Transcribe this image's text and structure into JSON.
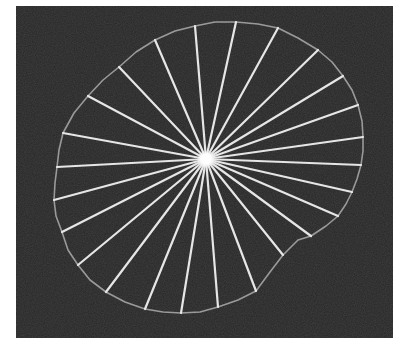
{
  "figure": {
    "width": 404,
    "height": 344,
    "page_background": "#ffffff",
    "frame": {
      "x": 16,
      "y": 6,
      "width": 377,
      "height": 332,
      "fill": "#262626"
    },
    "center": {
      "x": 206,
      "y": 159,
      "glow_radius": 9,
      "color": "#ffffff"
    },
    "spoke_color": "#e6e6e6",
    "spoke_width": 2.2,
    "contour_color": "#9a9a9a",
    "contour_width": 1.6,
    "contour": [
      [
        195,
        26
      ],
      [
        215,
        22
      ],
      [
        236,
        22
      ],
      [
        258,
        24
      ],
      [
        278,
        28
      ],
      [
        298,
        38
      ],
      [
        318,
        50
      ],
      [
        332,
        62
      ],
      [
        343,
        76
      ],
      [
        352,
        90
      ],
      [
        358,
        105
      ],
      [
        362,
        121
      ],
      [
        363,
        137
      ],
      [
        363,
        151
      ],
      [
        361,
        165
      ],
      [
        357,
        179
      ],
      [
        352,
        192
      ],
      [
        346,
        204
      ],
      [
        338,
        216
      ],
      [
        326,
        226
      ],
      [
        311,
        236
      ],
      [
        298,
        240
      ],
      [
        283,
        255
      ],
      [
        270,
        272
      ],
      [
        256,
        291
      ],
      [
        238,
        300
      ],
      [
        218,
        307
      ],
      [
        200,
        312
      ],
      [
        181,
        313
      ],
      [
        163,
        312
      ],
      [
        145,
        309
      ],
      [
        125,
        302
      ],
      [
        106,
        292
      ],
      [
        90,
        280
      ],
      [
        78,
        265
      ],
      [
        68,
        250
      ],
      [
        62,
        232
      ],
      [
        56,
        216
      ],
      [
        54,
        200
      ],
      [
        55,
        183
      ],
      [
        57,
        167
      ],
      [
        59,
        150
      ],
      [
        63,
        133
      ],
      [
        74,
        113
      ],
      [
        88,
        96
      ],
      [
        103,
        80
      ],
      [
        119,
        67
      ],
      [
        136,
        52
      ],
      [
        155,
        40
      ],
      [
        175,
        31
      ]
    ],
    "spokes": [
      [
        195,
        26
      ],
      [
        236,
        22
      ],
      [
        278,
        28
      ],
      [
        318,
        50
      ],
      [
        343,
        76
      ],
      [
        358,
        105
      ],
      [
        363,
        137
      ],
      [
        361,
        165
      ],
      [
        352,
        192
      ],
      [
        338,
        216
      ],
      [
        311,
        236
      ],
      [
        283,
        255
      ],
      [
        256,
        291
      ],
      [
        218,
        307
      ],
      [
        181,
        313
      ],
      [
        145,
        309
      ],
      [
        106,
        292
      ],
      [
        78,
        265
      ],
      [
        62,
        232
      ],
      [
        54,
        200
      ],
      [
        57,
        167
      ],
      [
        63,
        133
      ],
      [
        88,
        96
      ],
      [
        119,
        67
      ],
      [
        155,
        40
      ]
    ]
  }
}
